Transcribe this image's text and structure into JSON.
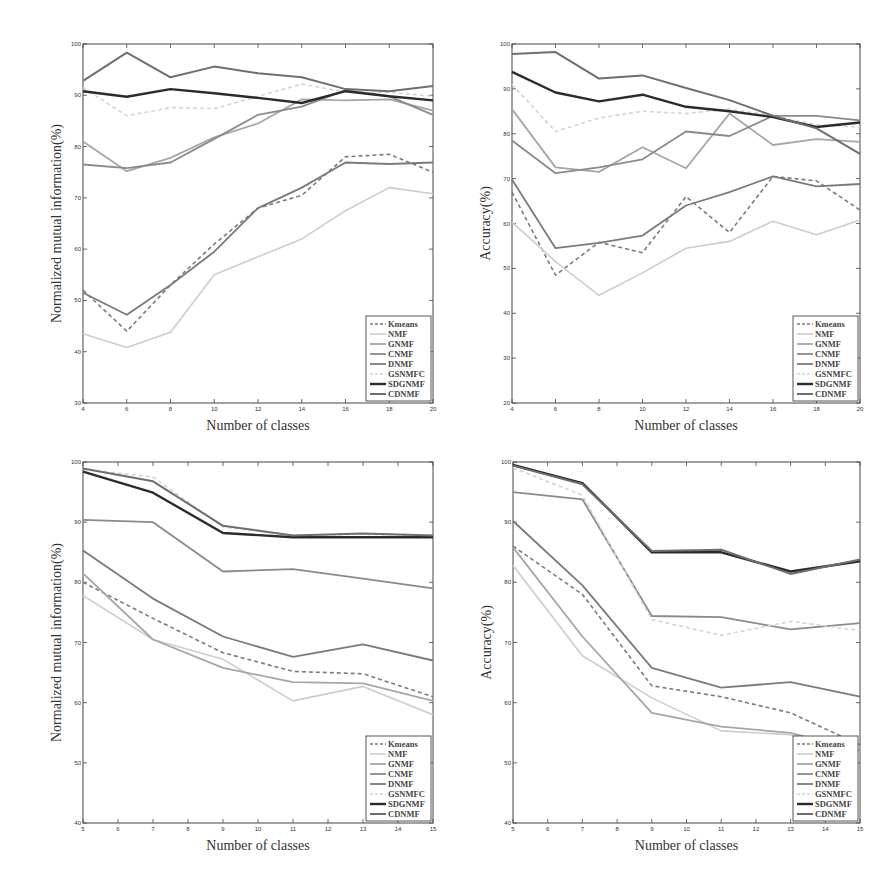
{
  "legend_labels": [
    "Kmeans",
    "NMF",
    "GNMF",
    "CNMF",
    "DNMF",
    "GSNMFC",
    "SDGNMF",
    "CDNMF"
  ],
  "series_styles": {
    "Kmeans": {
      "color": "#7a7a7a",
      "dash": "4,3",
      "width": 1.6
    },
    "NMF": {
      "color": "#cdcdcd",
      "dash": "",
      "width": 1.6
    },
    "GNMF": {
      "color": "#a6a6a6",
      "dash": "",
      "width": 1.8
    },
    "CNMF": {
      "color": "#8a8a8a",
      "dash": "",
      "width": 1.8
    },
    "DNMF": {
      "color": "#7a7a7a",
      "dash": "",
      "width": 1.8
    },
    "GSNMFC": {
      "color": "#d4d4d4",
      "dash": "4,3",
      "width": 1.6
    },
    "SDGNMF": {
      "color": "#2b2b2b",
      "dash": "",
      "width": 2.4
    },
    "CDNMF": {
      "color": "#6e6e6e",
      "dash": "",
      "width": 2.0
    }
  },
  "chart_data": [
    {
      "id": "top-left",
      "type": "line",
      "title": "",
      "xlabel": "Number of classes",
      "ylabel": "Normalized mutual information(%)",
      "x": [
        4,
        6,
        8,
        10,
        12,
        14,
        16,
        18,
        20
      ],
      "xticks": [
        4,
        6,
        8,
        10,
        12,
        14,
        16,
        18,
        20
      ],
      "yticks": [
        30,
        40,
        50,
        60,
        70,
        80,
        90,
        100
      ],
      "ylim": [
        30,
        100
      ],
      "grid": false,
      "legend_position": "lower right",
      "series": [
        {
          "name": "Kmeans",
          "values": [
            52,
            44,
            53,
            61,
            68,
            70.5,
            78,
            78.5,
            75
          ]
        },
        {
          "name": "NMF",
          "values": [
            43.5,
            40.8,
            43.8,
            55,
            58.5,
            62,
            67.5,
            72,
            70.8
          ]
        },
        {
          "name": "GNMF",
          "values": [
            81,
            75.2,
            77.8,
            81.8,
            84.5,
            89.2,
            89.0,
            89.2,
            87
          ]
        },
        {
          "name": "CNMF",
          "values": [
            76.5,
            75.8,
            76.9,
            81.5,
            86.2,
            87.8,
            91.0,
            89.8,
            86.2
          ]
        },
        {
          "name": "DNMF",
          "values": [
            51.5,
            47.2,
            53,
            59.5,
            68,
            72,
            76.9,
            76.6,
            76.9
          ]
        },
        {
          "name": "GSNMFC",
          "values": [
            91.5,
            86,
            87.6,
            87.4,
            89.8,
            92.2,
            90.6,
            90.6,
            89.8
          ]
        },
        {
          "name": "SDGNMF",
          "values": [
            90.8,
            89.7,
            91.2,
            90.4,
            89.5,
            88.5,
            90.8,
            89.8,
            89.0
          ]
        },
        {
          "name": "CDNMF",
          "values": [
            92.8,
            98.3,
            93.5,
            95.6,
            94.3,
            93.5,
            91.2,
            90.8,
            91.8
          ]
        }
      ]
    },
    {
      "id": "top-right",
      "type": "line",
      "title": "",
      "xlabel": "Number of classes",
      "ylabel": "Accuracy(%)",
      "x": [
        4,
        6,
        8,
        10,
        12,
        14,
        16,
        18,
        20
      ],
      "xticks": [
        4,
        6,
        8,
        10,
        12,
        14,
        16,
        18,
        20
      ],
      "yticks": [
        20,
        30,
        40,
        50,
        60,
        70,
        80,
        90,
        100
      ],
      "ylim": [
        20,
        100
      ],
      "grid": false,
      "legend_position": "lower right",
      "series": [
        {
          "name": "Kmeans",
          "values": [
            67,
            48.5,
            55.8,
            53.5,
            66,
            58,
            70.5,
            69.5,
            63
          ]
        },
        {
          "name": "NMF",
          "values": [
            60.3,
            51.5,
            44,
            49,
            54.5,
            56,
            60.5,
            57.5,
            60.8
          ]
        },
        {
          "name": "GNMF",
          "values": [
            85.5,
            72.5,
            71.5,
            77,
            72.3,
            84.5,
            77.5,
            78.8,
            78.2
          ]
        },
        {
          "name": "CNMF",
          "values": [
            78.5,
            71.2,
            72.5,
            74.3,
            80.5,
            79.5,
            84,
            84,
            83
          ]
        },
        {
          "name": "DNMF",
          "values": [
            69.8,
            54.5,
            55.7,
            57.3,
            64,
            67,
            70.5,
            68.3,
            68.8
          ]
        },
        {
          "name": "GSNMFC",
          "values": [
            91,
            80.5,
            83.5,
            85,
            84.5,
            85.5,
            84,
            82,
            81.5
          ]
        },
        {
          "name": "SDGNMF",
          "values": [
            93.8,
            89.2,
            87.2,
            88.7,
            86,
            85,
            83.7,
            81.5,
            82.5
          ]
        },
        {
          "name": "CDNMF",
          "values": [
            97.8,
            98.2,
            92.3,
            93,
            90.2,
            87.5,
            84,
            81.2,
            75.5
          ]
        }
      ]
    },
    {
      "id": "bottom-left",
      "type": "line",
      "title": "",
      "xlabel": "Number of classes",
      "ylabel": "Normalized mutual information(%)",
      "x": [
        5,
        7,
        9,
        11,
        13,
        15
      ],
      "xticks": [
        5,
        6,
        7,
        8,
        9,
        10,
        11,
        12,
        13,
        14,
        15
      ],
      "yticks": [
        40,
        50,
        60,
        70,
        80,
        90,
        100
      ],
      "ylim": [
        40,
        100
      ],
      "grid": false,
      "legend_position": "lower right",
      "series": [
        {
          "name": "Kmeans",
          "values": [
            80,
            74,
            68.3,
            65.2,
            64.8,
            61
          ]
        },
        {
          "name": "NMF",
          "values": [
            77.8,
            70.5,
            67.2,
            60.3,
            62.7,
            58
          ]
        },
        {
          "name": "GNMF",
          "values": [
            81.5,
            70.5,
            65.8,
            63.4,
            63.2,
            60.3
          ]
        },
        {
          "name": "CNMF",
          "values": [
            90.4,
            90,
            81.8,
            82.2,
            80.6,
            79
          ]
        },
        {
          "name": "DNMF",
          "values": [
            85.3,
            77.3,
            71,
            67.6,
            69.7,
            67
          ]
        },
        {
          "name": "GSNMFC",
          "values": [
            98.8,
            97.5,
            89.2,
            87.8,
            88,
            87.8
          ]
        },
        {
          "name": "SDGNMF",
          "values": [
            98.4,
            94.9,
            88.2,
            87.5,
            87.5,
            87.5
          ]
        },
        {
          "name": "CDNMF",
          "values": [
            98.9,
            96.8,
            89.4,
            87.8,
            88.1,
            87.8
          ]
        }
      ]
    },
    {
      "id": "bottom-right",
      "type": "line",
      "title": "",
      "xlabel": "Number of classes",
      "ylabel": "Accuracy(%)",
      "x": [
        5,
        7,
        9,
        11,
        13,
        15
      ],
      "xticks": [
        5,
        6,
        7,
        8,
        9,
        10,
        11,
        12,
        13,
        14,
        15
      ],
      "yticks": [
        40,
        50,
        60,
        70,
        80,
        90,
        100
      ],
      "ylim": [
        40,
        100
      ],
      "grid": false,
      "legend_position": "lower right",
      "series": [
        {
          "name": "Kmeans",
          "values": [
            86,
            78,
            62.8,
            61,
            58.3,
            53
          ]
        },
        {
          "name": "NMF",
          "values": [
            82.8,
            67.8,
            60.8,
            55.3,
            54.7,
            52
          ]
        },
        {
          "name": "GNMF",
          "values": [
            85.8,
            71,
            58.3,
            56,
            55,
            52
          ]
        },
        {
          "name": "CNMF",
          "values": [
            95,
            93.8,
            74.4,
            74.2,
            72.2,
            73.2
          ]
        },
        {
          "name": "DNMF",
          "values": [
            90.2,
            79.5,
            65.8,
            62.5,
            63.4,
            61
          ]
        },
        {
          "name": "GSNMFC",
          "values": [
            99,
            94.5,
            73.8,
            71.2,
            73.5,
            72
          ]
        },
        {
          "name": "SDGNMF",
          "values": [
            99.5,
            96.5,
            85,
            85,
            81.8,
            83.5
          ]
        },
        {
          "name": "CDNMF",
          "values": [
            99.4,
            96.3,
            85.2,
            85.4,
            81.4,
            83.8
          ]
        }
      ]
    }
  ]
}
